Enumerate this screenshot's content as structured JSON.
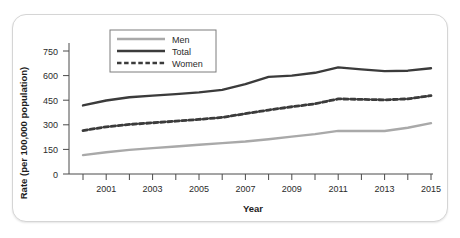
{
  "chart_data": {
    "type": "line",
    "title": "",
    "xlabel": "Year",
    "ylabel": "Rate (per 100,000 population)",
    "x": [
      2000,
      2001,
      2002,
      2003,
      2004,
      2005,
      2006,
      2007,
      2008,
      2009,
      2010,
      2011,
      2012,
      2013,
      2014,
      2015
    ],
    "xlim": [
      2000,
      2015
    ],
    "ylim": [
      0,
      800
    ],
    "yticks": [
      0,
      150,
      300,
      450,
      600,
      750
    ],
    "ytick_labels": [
      "0",
      "150",
      "300",
      "450",
      "600",
      "750"
    ],
    "xticks": [
      2000,
      2001,
      2002,
      2003,
      2004,
      2005,
      2006,
      2007,
      2008,
      2009,
      2010,
      2011,
      2012,
      2013,
      2014,
      2015
    ],
    "xtick_labels": [
      "",
      "2001",
      "",
      "2003",
      "",
      "2005",
      "",
      "2007",
      "",
      "2009",
      "",
      "2011",
      "",
      "2013",
      "",
      "2015"
    ],
    "grid": false,
    "legend_position": "top-left-inside",
    "series": [
      {
        "name": "Men",
        "style": "solid",
        "color": "#a9a9a9",
        "values": [
          115,
          133,
          147,
          158,
          168,
          178,
          188,
          198,
          212,
          228,
          243,
          263,
          262,
          262,
          282,
          310
        ]
      },
      {
        "name": "Total",
        "style": "solid",
        "color": "#3b3b3b",
        "values": [
          418,
          448,
          468,
          478,
          487,
          498,
          513,
          548,
          592,
          600,
          617,
          650,
          638,
          627,
          630,
          645
        ]
      },
      {
        "name": "Women",
        "style": "dashed",
        "color": "#3b3b3b",
        "values": [
          265,
          288,
          302,
          312,
          322,
          333,
          345,
          368,
          390,
          410,
          428,
          458,
          455,
          452,
          458,
          478
        ]
      }
    ]
  }
}
